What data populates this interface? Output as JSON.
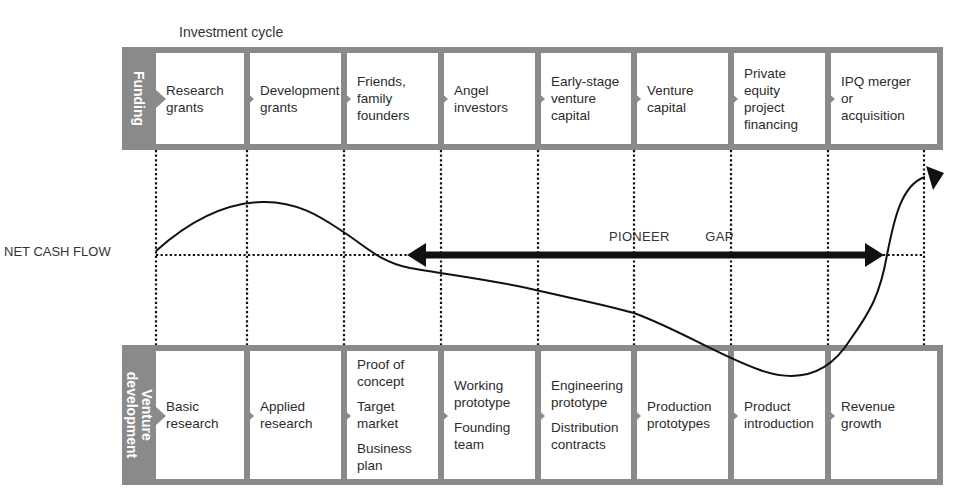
{
  "title": "Investment cycle",
  "funding": {
    "label": "Funding",
    "stages": [
      {
        "lines": [
          "Research",
          "grants"
        ]
      },
      {
        "lines": [
          "Development",
          "grants"
        ]
      },
      {
        "lines": [
          "Friends,",
          "family",
          "founders"
        ]
      },
      {
        "lines": [
          "Angel",
          "investors"
        ]
      },
      {
        "lines": [
          "Early-stage",
          "venture",
          "capital"
        ]
      },
      {
        "lines": [
          "Venture",
          "capital"
        ]
      },
      {
        "lines": [
          "Private",
          "equity",
          "project",
          "financing"
        ]
      },
      {
        "lines": [
          "IPQ merger",
          "or",
          "acquisition"
        ]
      }
    ]
  },
  "venture_development": {
    "label_line1": "Venture",
    "label_line2": "development",
    "stages": [
      {
        "groups": [
          [
            "Basic",
            "research"
          ]
        ]
      },
      {
        "groups": [
          [
            "Applied",
            "research"
          ]
        ]
      },
      {
        "groups": [
          [
            "Proof of",
            "concept"
          ],
          [
            "Target",
            "market"
          ],
          [
            "Business",
            "plan"
          ]
        ]
      },
      {
        "groups": [
          [
            "Working",
            "prototype"
          ],
          [
            "Founding",
            "team"
          ]
        ]
      },
      {
        "groups": [
          [
            "Engineering",
            "prototype"
          ],
          [
            "Distribution",
            "contracts"
          ]
        ]
      },
      {
        "groups": [
          [
            "Production",
            "prototypes"
          ]
        ]
      },
      {
        "groups": [
          [
            "Product",
            "introduction"
          ]
        ]
      },
      {
        "groups": [
          [
            "Revenue",
            "growth"
          ]
        ]
      }
    ]
  },
  "chart": {
    "net_cash_flow_label": "NET CASH FLOW",
    "pioneer_gap_label": "PIONEER   GAP",
    "curve_color": "#111111",
    "band_color": "#8a8a8a"
  }
}
